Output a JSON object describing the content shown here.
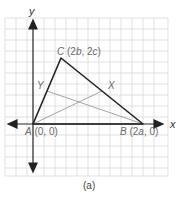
{
  "figure": {
    "caption": "(a)",
    "axes": {
      "x_label": "x",
      "y_label": "y"
    },
    "points": {
      "A": {
        "name": "A",
        "coords": "(0, 0)"
      },
      "B": {
        "name": "B",
        "coords_pre": "(2",
        "coords_var": "a",
        "coords_post": ", 0)"
      },
      "C": {
        "name": "C",
        "coords_pre": "(2",
        "coords_var1": "b",
        "coords_mid": ", 2",
        "coords_var2": "c",
        "coords_post": ")"
      },
      "X": {
        "name": "X"
      },
      "Y": {
        "name": "Y"
      }
    },
    "colors": {
      "triangle": "#222222",
      "median": "#9a9a9a",
      "grid": "#d8d8d8",
      "axis": "#222222",
      "label": "#6a6a6a"
    }
  }
}
